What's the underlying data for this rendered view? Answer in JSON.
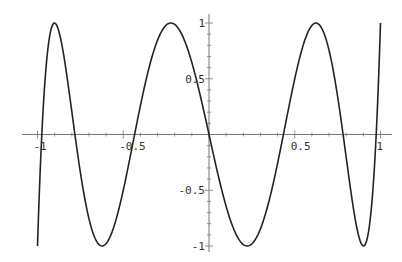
{
  "chart_data": {
    "type": "line",
    "title": "",
    "xlabel": "",
    "ylabel": "",
    "xlim": [
      -1,
      1
    ],
    "ylim": [
      -1,
      1
    ],
    "grid": false,
    "legend": null,
    "function": "T7(x) = cos(7 arccos x)",
    "x_ticks": [
      {
        "value": -1,
        "label": "-1"
      },
      {
        "value": -0.5,
        "label": "-0.5"
      },
      {
        "value": 0.5,
        "label": "0.5"
      },
      {
        "value": 1,
        "label": "1"
      }
    ],
    "y_ticks": [
      {
        "value": 1,
        "label": "1"
      },
      {
        "value": 0.5,
        "label": "0.5"
      },
      {
        "value": -0.5,
        "label": "-0.5"
      },
      {
        "value": -1,
        "label": "-1"
      }
    ],
    "series": [
      {
        "name": "curve",
        "x": [
          -1.0,
          -0.9,
          -0.8,
          -0.7,
          -0.6,
          -0.5,
          -0.4,
          -0.3,
          -0.2,
          -0.1,
          0.0,
          0.1,
          0.2,
          0.3,
          0.4,
          0.5,
          0.6,
          0.7,
          0.8,
          0.9,
          1.0
        ],
        "y": [
          -1.0,
          1.0,
          0.17,
          -0.88,
          -0.95,
          0.5,
          1.0,
          0.34,
          -0.48,
          0.7,
          0.0,
          -0.7,
          0.48,
          -0.34,
          -1.0,
          -0.5,
          0.95,
          0.88,
          -0.17,
          -1.0,
          1.0
        ]
      }
    ]
  },
  "colors": {
    "curve": "#222222",
    "axis": "#777777",
    "background": "#ffffff"
  }
}
